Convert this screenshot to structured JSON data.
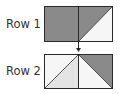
{
  "rows": [
    {
      "label": "Row 1"
    },
    {
      "label": "Row 2"
    }
  ],
  "colors": {
    "dark": "#8a8a8a",
    "light": "#e4e4e4",
    "lightest": "#f6f6f6",
    "stroke": "#2a2a2a"
  }
}
